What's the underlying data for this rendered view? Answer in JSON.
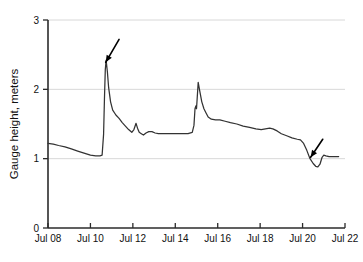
{
  "chart_data": {
    "type": "line",
    "title": "",
    "xlabel": "",
    "ylabel": "Gauge height, meters",
    "xlim": [
      8,
      22
    ],
    "ylim": [
      0,
      3
    ],
    "grid": true,
    "legend": null,
    "x_tick_labels": [
      "Jul 08",
      "Jul 10",
      "Jul 12",
      "Jul 14",
      "Jul 16",
      "Jul 18",
      "Jul 20",
      "Jul 22"
    ],
    "x_tick_values": [
      8,
      10,
      12,
      14,
      16,
      18,
      20,
      22
    ],
    "y_tick_labels": [
      "0",
      "1",
      "2",
      "3"
    ],
    "y_tick_values": [
      0,
      1,
      2,
      3
    ],
    "line_color": "#333333",
    "grid_color": "#d8d8d8",
    "axis_color": "#2b2b2b",
    "series": [
      {
        "name": "gauge-height",
        "x": [
          8.0,
          8.25,
          8.5,
          8.8,
          9.1,
          9.4,
          9.7,
          10.0,
          10.25,
          10.45,
          10.55,
          10.62,
          10.66,
          10.7,
          10.74,
          10.8,
          10.86,
          10.95,
          11.05,
          11.2,
          11.35,
          11.5,
          11.65,
          11.8,
          11.95,
          12.05,
          12.15,
          12.22,
          12.3,
          12.4,
          12.5,
          12.62,
          12.75,
          12.9,
          13.05,
          13.2,
          13.4,
          13.6,
          13.85,
          14.1,
          14.35,
          14.6,
          14.8,
          14.88,
          14.93,
          14.97,
          15.0,
          15.03,
          15.08,
          15.15,
          15.25,
          15.35,
          15.45,
          15.55,
          15.7,
          15.9,
          16.1,
          16.35,
          16.6,
          16.9,
          17.2,
          17.5,
          17.8,
          18.05,
          18.25,
          18.45,
          18.6,
          18.8,
          19.0,
          19.25,
          19.5,
          19.75,
          19.9,
          20.05,
          20.2,
          20.35,
          20.5,
          20.62,
          20.72,
          20.82,
          20.92,
          21.0,
          21.1,
          21.25,
          21.45,
          21.7
        ],
        "y": [
          1.22,
          1.21,
          1.19,
          1.17,
          1.14,
          1.11,
          1.08,
          1.05,
          1.04,
          1.04,
          1.05,
          1.35,
          1.85,
          2.28,
          2.42,
          2.25,
          2.02,
          1.82,
          1.7,
          1.63,
          1.58,
          1.52,
          1.47,
          1.42,
          1.38,
          1.42,
          1.51,
          1.44,
          1.38,
          1.36,
          1.34,
          1.37,
          1.39,
          1.39,
          1.37,
          1.36,
          1.36,
          1.36,
          1.36,
          1.36,
          1.36,
          1.36,
          1.38,
          1.48,
          1.72,
          1.76,
          1.72,
          1.86,
          2.1,
          1.98,
          1.82,
          1.72,
          1.66,
          1.6,
          1.57,
          1.56,
          1.56,
          1.54,
          1.52,
          1.5,
          1.47,
          1.45,
          1.43,
          1.42,
          1.43,
          1.44,
          1.43,
          1.4,
          1.36,
          1.33,
          1.3,
          1.28,
          1.27,
          1.22,
          1.12,
          1.0,
          0.93,
          0.89,
          0.88,
          0.92,
          1.02,
          1.05,
          1.04,
          1.03,
          1.03,
          1.03
        ]
      }
    ],
    "annotations": [
      {
        "name": "arrow-flood-peak",
        "label": "",
        "points_to_x": 10.72,
        "points_to_y": 2.39,
        "tail_x": 11.35,
        "tail_y": 2.72
      },
      {
        "name": "arrow-low-dip",
        "label": "",
        "points_to_x": 20.38,
        "points_to_y": 1.02,
        "tail_x": 20.95,
        "tail_y": 1.28
      }
    ]
  }
}
